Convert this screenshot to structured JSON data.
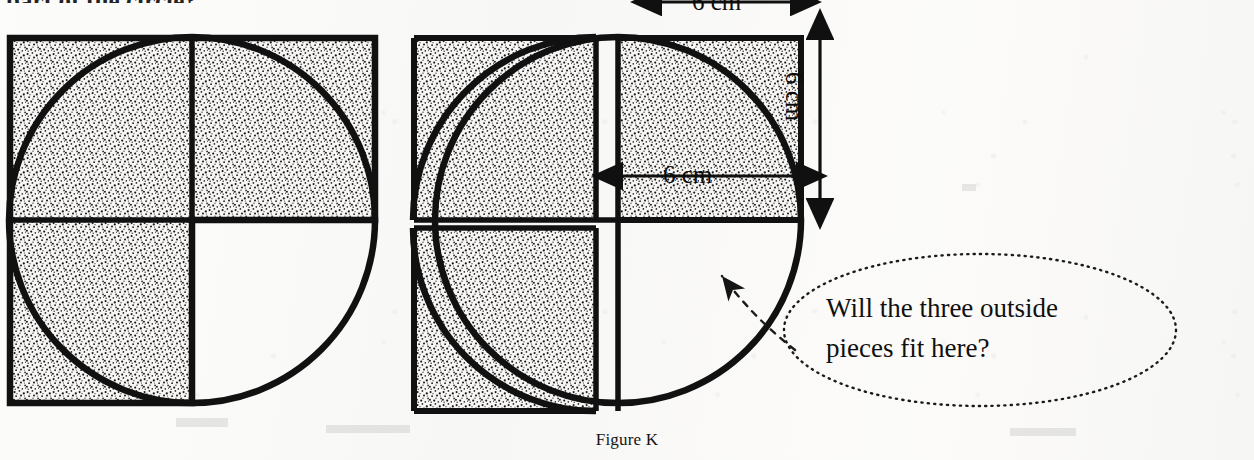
{
  "page": {
    "width": 1254,
    "height": 460,
    "background_color": "#fbfbfa",
    "ink_color": "#111111",
    "stipple_color": "#1a1a1a"
  },
  "cropped_text_above_figure": "part of the circle?",
  "caption": "Figure K",
  "callout": {
    "text": "Will the three outside\npieces fit here?",
    "line1": "Will the three outside",
    "line2": "pieces fit here?",
    "border_style": "dotted-ellipse",
    "leader_style": "dashed-arrow"
  },
  "dimensions": {
    "top": "6 cm",
    "right": "6 cm",
    "inner": "6 cm",
    "unit": "cm",
    "value": 6
  },
  "figures": [
    {
      "name": "left-diagram",
      "description": "Circle with three shaded quarter-squares in place; fourth quadrant empty",
      "center": [
        192,
        220
      ],
      "radius": 183,
      "quadrant_size": 183,
      "shaded_quadrants": [
        "top-left",
        "top-right",
        "bottom-left"
      ],
      "empty_quadrant": "bottom-right"
    },
    {
      "name": "right-diagram",
      "description": "Same circle with the shaded quarter-squares slid outward, leaving crescent gaps",
      "center": [
        618,
        220
      ],
      "radius": 183,
      "quadrant_size": 183,
      "shaded_quadrants": [
        "top-left",
        "top-right",
        "bottom-left"
      ],
      "empty_quadrant": "bottom-right",
      "offset": 22
    }
  ]
}
